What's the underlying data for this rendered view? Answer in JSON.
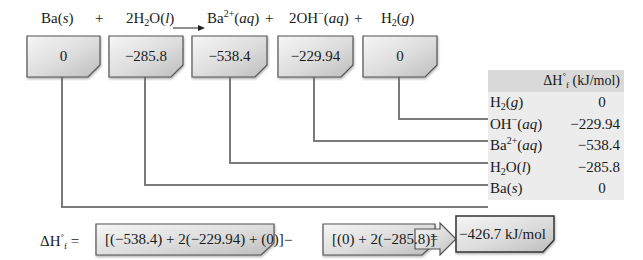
{
  "equation": {
    "terms": [
      {
        "formula": "Ba",
        "state": "s",
        "coef": ""
      },
      {
        "op": "+"
      },
      {
        "formula": "2H₂O",
        "state": "l"
      },
      {
        "op": "arrow"
      },
      {
        "formula": "Ba²⁺",
        "state": "aq"
      },
      {
        "op": "+"
      },
      {
        "formula": "2OH⁻",
        "state": "aq"
      },
      {
        "op": "+"
      },
      {
        "formula": "H₂",
        "state": "g"
      }
    ],
    "plus": "+"
  },
  "boxes": [
    {
      "species": "Ba(s)",
      "value": "0"
    },
    {
      "species": "H2O(l)",
      "value": "−285.8"
    },
    {
      "species": "Ba2+(aq)",
      "value": "−538.4"
    },
    {
      "species": "OH−(aq)",
      "value": "−229.94"
    },
    {
      "species": "H2(g)",
      "value": "0"
    }
  ],
  "table": {
    "header": "ΔH°f (kJ/mol)",
    "rows": [
      {
        "species": "H2(g)",
        "value": "0"
      },
      {
        "species": "OH−(aq)",
        "value": "−229.94"
      },
      {
        "species": "Ba2+(aq)",
        "value": "−538.4"
      },
      {
        "species": "H2O(l)",
        "value": "−285.8"
      },
      {
        "species": "Ba(s)",
        "value": "0"
      }
    ]
  },
  "calculation": {
    "lhs": "ΔH°f =",
    "products_sum": "[(−538.4) + 2(−229.94) + (0)]",
    "minus": "−",
    "reactants_sum": "[(0) + 2(−285.8)]",
    "equals": "=",
    "result": "−426.7 kJ/mol"
  },
  "colors": {
    "box_fill_light": "#f4f4f4",
    "box_fill_dark": "#c8c8c8",
    "box_border": "#555555",
    "connector": "#7a7a7a",
    "table_bg": "#ececec",
    "table_header_bg": "#d9d9d9"
  }
}
